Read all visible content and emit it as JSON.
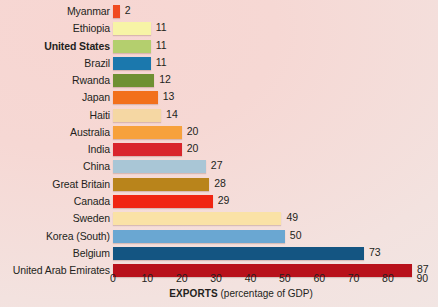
{
  "chart_data": {
    "type": "bar",
    "orientation": "horizontal",
    "title": "",
    "xlabel": "EXPORTS (percentage of GDP)",
    "xlabel_strong": "EXPORTS",
    "xlabel_weak": " (percentage of GDP)",
    "ylabel": "",
    "xlim": [
      0,
      90
    ],
    "xticks": [
      0,
      10,
      20,
      30,
      40,
      50,
      60,
      70,
      80,
      90
    ],
    "xtick_labels": [
      "0",
      "10",
      "20",
      "30",
      "40",
      "50",
      "60",
      "70",
      "80",
      "90"
    ],
    "grid": false,
    "legend": "none",
    "categories": [
      "Myanmar",
      "Ethiopia",
      "United States",
      "Brazil",
      "Rwanda",
      "Japan",
      "Haiti",
      "Australia",
      "India",
      "China",
      "Great Britain",
      "Canada",
      "Sweden",
      "Korea (South)",
      "Belgium",
      "United Arab Emirates"
    ],
    "values": [
      2,
      11,
      11,
      11,
      12,
      13,
      14,
      20,
      20,
      27,
      28,
      29,
      49,
      50,
      73,
      87
    ],
    "value_labels": [
      "2",
      "11",
      "11",
      "11",
      "12",
      "13",
      "14",
      "20",
      "20",
      "27",
      "28",
      "29",
      "49",
      "50",
      "73",
      "87"
    ],
    "bar_colors": [
      "#f04a20",
      "#f7f4a6",
      "#b4cf6e",
      "#1b78ad",
      "#6f9032",
      "#f2701c",
      "#f5d7a3",
      "#f7a13c",
      "#d9252c",
      "#a9c6d6",
      "#b9841b",
      "#f02512",
      "#fae2a6",
      "#6aa7d2",
      "#145582",
      "#b8111b"
    ],
    "highlighted_category": "United States"
  },
  "style": {
    "background_top_left": "#f7d6d2",
    "background_bottom_right": "#f1e7e5",
    "text_color": "#231f20"
  }
}
